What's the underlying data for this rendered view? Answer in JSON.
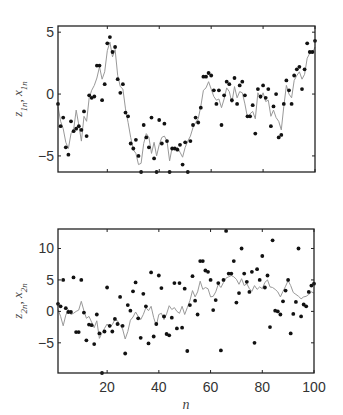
{
  "figure": {
    "background": "#ffffff",
    "axis_color": "#222222",
    "dot_color": "#111111",
    "line_color": "#999999"
  },
  "chart_data": [
    {
      "type": "line+scatter",
      "title": "",
      "xlabel": "",
      "ylabel": "z_1n, x_1n",
      "ylabel_main": "z",
      "ylabel_sub1": "1n",
      "ylabel_sep": ", ",
      "ylabel_main2": "x",
      "ylabel_sub2": "1n",
      "xlim": [
        1,
        100
      ],
      "ylim": [
        -6.3,
        5.5
      ],
      "yticks": [
        -5,
        0,
        5
      ],
      "yticklabels": [
        "-5",
        "0",
        "5"
      ],
      "xticks": [
        20,
        40,
        60,
        80,
        100
      ],
      "xticklabels": [],
      "grid": false,
      "plot_box": {
        "left": 58,
        "top": 26,
        "right": 315,
        "bottom": 172
      },
      "series": [
        {
          "name": "z_1n (observations)",
          "style": "dots",
          "x": [
            1,
            2,
            3,
            4,
            5,
            6,
            7,
            8,
            9,
            10,
            11,
            12,
            13,
            14,
            15,
            16,
            17,
            18,
            19,
            20,
            21,
            22,
            23,
            24,
            25,
            26,
            27,
            28,
            29,
            30,
            31,
            32,
            33,
            34,
            35,
            36,
            37,
            38,
            39,
            40,
            41,
            42,
            43,
            44,
            45,
            46,
            47,
            48,
            49,
            50,
            51,
            52,
            53,
            54,
            55,
            56,
            57,
            58,
            59,
            60,
            61,
            62,
            63,
            64,
            65,
            66,
            67,
            68,
            69,
            70,
            71,
            72,
            73,
            74,
            75,
            76,
            77,
            78,
            79,
            80,
            81,
            82,
            83,
            84,
            85,
            86,
            87,
            88,
            89,
            90,
            91,
            92,
            93,
            94,
            95,
            96,
            97,
            98,
            99,
            100
          ],
          "values": [
            -0.8,
            -2.6,
            -1.9,
            -4.3,
            -4.9,
            -2.2,
            -3.0,
            -2.8,
            -2.6,
            -2.9,
            -1.4,
            -3.4,
            -0.1,
            -0.3,
            -0.2,
            2.3,
            2.3,
            -0.5,
            0.8,
            4.1,
            4.6,
            3.4,
            3.8,
            1.2,
            0.1,
            0.8,
            -1.5,
            -1.8,
            -4.0,
            -4.4,
            -3.7,
            -5.0,
            -6.3,
            -2.5,
            -3.5,
            -4.3,
            -1.9,
            -5.2,
            -6.3,
            -2.1,
            -4.0,
            -2.4,
            -3.8,
            -6.3,
            -4.4,
            -4.4,
            -4.5,
            -4.1,
            -5.7,
            -3.9,
            -6.3,
            -3.8,
            -2.5,
            -1.9,
            -2.3,
            -1.1,
            1.4,
            1.4,
            1.7,
            1.5,
            0.3,
            -0.8,
            0.3,
            -2.5,
            -0.1,
            1.0,
            0.8,
            -0.5,
            1.3,
            -0.8,
            0.7,
            1.0,
            -0.1,
            -1.8,
            -1.8,
            -0.9,
            -3.2,
            0.4,
            -0.2,
            0.7,
            -0.3,
            0.4,
            -2.6,
            -1.0,
            0.0,
            -3.5,
            -3.3,
            -0.8,
            1.1,
            0.3,
            -0.8,
            1.5,
            2.0,
            2.2,
            0.4,
            2.0,
            4.1,
            3.4,
            3.4,
            4.3
          ]
        },
        {
          "name": "x_1n (estimate)",
          "style": "line",
          "x": [
            1,
            2,
            3,
            4,
            5,
            6,
            7,
            8,
            9,
            10,
            11,
            12,
            13,
            14,
            15,
            16,
            17,
            18,
            19,
            20,
            21,
            22,
            23,
            24,
            25,
            26,
            27,
            28,
            29,
            30,
            31,
            32,
            33,
            34,
            35,
            36,
            37,
            38,
            39,
            40,
            41,
            42,
            43,
            44,
            45,
            46,
            47,
            48,
            49,
            50,
            51,
            52,
            53,
            54,
            55,
            56,
            57,
            58,
            59,
            60,
            61,
            62,
            63,
            64,
            65,
            66,
            67,
            68,
            69,
            70,
            71,
            72,
            73,
            74,
            75,
            76,
            77,
            78,
            79,
            80,
            81,
            82,
            83,
            84,
            85,
            86,
            87,
            88,
            89,
            90,
            91,
            92,
            93,
            94,
            95,
            96,
            97,
            98,
            99,
            100
          ],
          "values": [
            -1.0,
            -2.2,
            -2.8,
            -3.9,
            -4.4,
            -3.2,
            -2.9,
            -1.3,
            -2.5,
            -3.8,
            -1.8,
            -2.2,
            -0.3,
            0.3,
            0.7,
            1.3,
            2.2,
            1.2,
            1.8,
            3.5,
            4.2,
            3.0,
            3.6,
            1.5,
            0.6,
            0.4,
            -1.2,
            -2.3,
            -3.5,
            -4.5,
            -4.8,
            -5.7,
            -5.6,
            -4.0,
            -3.2,
            -3.5,
            -4.8,
            -3.9,
            -5.0,
            -4.1,
            -3.5,
            -3.4,
            -3.8,
            -5.4,
            -4.3,
            -4.5,
            -4.3,
            -4.7,
            -5.1,
            -4.3,
            -3.8,
            -3.4,
            -2.7,
            -2.3,
            -2.0,
            -1.0,
            0.3,
            0.5,
            1.0,
            0.4,
            -0.2,
            -0.5,
            -0.4,
            -1.1,
            -0.4,
            0.5,
            0.2,
            -0.7,
            0.6,
            -0.3,
            0.2,
            0.1,
            -0.8,
            -1.9,
            -1.6,
            -1.4,
            -2.0,
            0.1,
            -0.4,
            0.1,
            -0.6,
            -0.5,
            -1.8,
            -1.3,
            -1.9,
            -2.2,
            -2.9,
            -1.0,
            0.7,
            0.0,
            -0.3,
            1.1,
            1.5,
            1.8,
            1.2,
            1.6,
            2.9,
            3.3,
            3.3,
            3.8
          ]
        }
      ]
    },
    {
      "type": "line+scatter",
      "title": "",
      "xlabel": "n",
      "ylabel": "z_2n, x_2n",
      "ylabel_main": "z",
      "ylabel_sub1": "2n",
      "ylabel_sep": ", ",
      "ylabel_main2": "x",
      "ylabel_sub2": "2n",
      "xlim": [
        1,
        100
      ],
      "ylim": [
        -9.8,
        13.1
      ],
      "yticks": [
        -5,
        0,
        5,
        10
      ],
      "yticklabels": [
        "-5",
        "0",
        "5",
        "10"
      ],
      "xticks": [
        20,
        40,
        60,
        80,
        100
      ],
      "xticklabels": [
        "20",
        "40",
        "60",
        "80",
        "100"
      ],
      "grid": false,
      "plot_box": {
        "left": 58,
        "top": 229,
        "right": 314,
        "bottom": 373
      },
      "series": [
        {
          "name": "z_2n (observations)",
          "style": "dots",
          "x": [
            1,
            2,
            3,
            4,
            5,
            6,
            7,
            8,
            9,
            10,
            11,
            12,
            13,
            14,
            15,
            16,
            17,
            18,
            19,
            20,
            21,
            22,
            23,
            24,
            25,
            26,
            27,
            28,
            29,
            30,
            31,
            32,
            33,
            34,
            35,
            36,
            37,
            38,
            39,
            40,
            41,
            42,
            43,
            44,
            45,
            46,
            47,
            48,
            49,
            50,
            51,
            52,
            53,
            54,
            55,
            56,
            57,
            58,
            59,
            60,
            61,
            62,
            63,
            64,
            65,
            66,
            67,
            68,
            69,
            70,
            71,
            72,
            73,
            74,
            75,
            76,
            77,
            78,
            79,
            80,
            81,
            82,
            83,
            84,
            85,
            86,
            87,
            88,
            89,
            90,
            91,
            92,
            93,
            94,
            95,
            96,
            97,
            98,
            99,
            100
          ],
          "values": [
            1.2,
            0.8,
            5.0,
            0.5,
            -0.1,
            -0.1,
            5.4,
            -3.3,
            -3.3,
            5.0,
            -0.2,
            -4.6,
            -2.1,
            -2.2,
            -5.2,
            -0.5,
            -3.5,
            -9.8,
            -3.2,
            3.8,
            -2.3,
            -3.2,
            -1.2,
            -2.0,
            2.3,
            -2.3,
            -6.7,
            1.0,
            0.1,
            3.2,
            4.6,
            -1.1,
            -4.2,
            2.8,
            0.8,
            -5.1,
            6.2,
            -4.0,
            -2.0,
            5.7,
            3.7,
            -0.8,
            -3.6,
            -3.8,
            -1.0,
            4.5,
            -2.7,
            4.5,
            -2.6,
            3.6,
            -6.3,
            1.0,
            5.6,
            1.7,
            -0.5,
            8.0,
            8.0,
            6.5,
            6.3,
            5.0,
            0.2,
            1.8,
            4.5,
            -6.2,
            5.0,
            12.8,
            6.0,
            6.0,
            8.0,
            1.4,
            2.9,
            10.0,
            6.0,
            4.7,
            3.1,
            6.3,
            -5.0,
            6.7,
            5.0,
            8.8,
            3.8,
            5.7,
            -2.5,
            11.3,
            0.1,
            0.0,
            -0.5,
            1.6,
            3.3,
            5.0,
            -3.5,
            -0.4,
            1.5,
            10.0,
            -0.8,
            1.1,
            0.8,
            3.1,
            4.1,
            4.4
          ]
        },
        {
          "name": "x_2n (estimate)",
          "style": "line",
          "x": [
            1,
            2,
            3,
            4,
            5,
            6,
            7,
            8,
            9,
            10,
            11,
            12,
            13,
            14,
            15,
            16,
            17,
            18,
            19,
            20,
            21,
            22,
            23,
            24,
            25,
            26,
            27,
            28,
            29,
            30,
            31,
            32,
            33,
            34,
            35,
            36,
            37,
            38,
            39,
            40,
            41,
            42,
            43,
            44,
            45,
            46,
            47,
            48,
            49,
            50,
            51,
            52,
            53,
            54,
            55,
            56,
            57,
            58,
            59,
            60,
            61,
            62,
            63,
            64,
            65,
            66,
            67,
            68,
            69,
            70,
            71,
            72,
            73,
            74,
            75,
            76,
            77,
            78,
            79,
            80,
            81,
            82,
            83,
            84,
            85,
            86,
            87,
            88,
            89,
            90,
            91,
            92,
            93,
            94,
            95,
            96,
            97,
            98,
            99,
            100
          ],
          "values": [
            0.3,
            -0.8,
            -2.3,
            -0.6,
            0.3,
            -0.5,
            -0.3,
            0.0,
            0.2,
            1.6,
            0.1,
            -1.1,
            -0.8,
            -1.7,
            -2.6,
            -1.5,
            -4.3,
            -3.4,
            -2.7,
            -2.0,
            -2.6,
            -2.1,
            -1.3,
            -1.5,
            -2.2,
            -2.8,
            -4.4,
            -3.2,
            -1.4,
            -0.9,
            -0.1,
            -0.8,
            -1.3,
            -0.5,
            0.6,
            0.1,
            0.8,
            -1.0,
            -2.3,
            -0.5,
            -0.3,
            -1.3,
            -0.4,
            0.9,
            0.3,
            0.6,
            0.0,
            -0.3,
            0.8,
            -0.5,
            0.6,
            1.7,
            3.3,
            2.3,
            3.1,
            4.8,
            3.5,
            3.8,
            3.6,
            2.3,
            2.4,
            3.1,
            4.3,
            3.8,
            4.6,
            5.3,
            5.5,
            5.7,
            5.5,
            5.1,
            4.3,
            5.2,
            4.1,
            4.4,
            3.6,
            3.2,
            4.1,
            3.5,
            3.9,
            3.6,
            4.6,
            5.0,
            3.9,
            3.8,
            3.5,
            3.1,
            2.3,
            3.2,
            4.0,
            4.9,
            4.1,
            3.0,
            2.7,
            2.4,
            2.0,
            2.3,
            2.4,
            2.7,
            3.1,
            2.9
          ]
        }
      ]
    }
  ]
}
